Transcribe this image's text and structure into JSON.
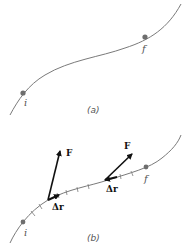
{
  "figure": {
    "panel_a": {
      "caption": "(a)",
      "start_label": "i",
      "end_label": "f"
    },
    "panel_b": {
      "caption": "(b)",
      "start_label": "i",
      "end_label": "f",
      "vectors": [
        {
          "force_label": "F",
          "displacement_label": "Δr"
        },
        {
          "force_label": "F",
          "displacement_label": "Δr"
        }
      ]
    },
    "colors": {
      "curve": "#7a7a7a",
      "point": "#6e6e6e",
      "arrow": "#111111"
    }
  }
}
